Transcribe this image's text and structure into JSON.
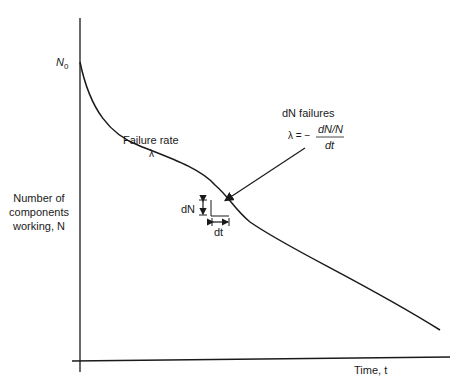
{
  "figure": {
    "y_axis_label_lines": [
      "Number of",
      "components",
      "working, N"
    ],
    "x_axis_label": "Time, t",
    "y_intercept_label": "N",
    "y_intercept_subscript": "0",
    "curve_annotation": {
      "line1": "Failure rate",
      "line2": "λ"
    },
    "callout": {
      "title": "dN failures",
      "lambda_prefix": "λ = −",
      "numerator": "dN/N",
      "denominator": "dt"
    },
    "increment_labels": {
      "dN": "dN",
      "dt": "dt"
    }
  },
  "colors": {
    "ink": "#1a1a1a",
    "background": "#ffffff"
  }
}
